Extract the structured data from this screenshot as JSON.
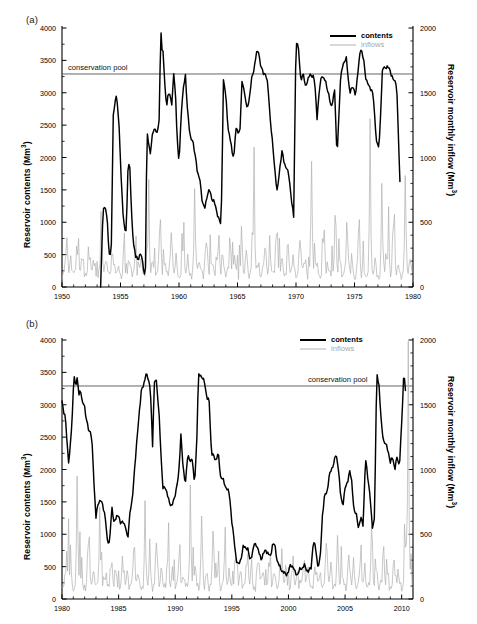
{
  "figure": {
    "background": "#ffffff",
    "panels": [
      {
        "id": "a",
        "tag": "(a)",
        "legend": {
          "contents_label": "contents",
          "inflows_label": "inflows",
          "position": "top-right"
        },
        "conservation_pool_label": "conservation pool",
        "conservation_pool_align": "left"
      },
      {
        "id": "b",
        "tag": "(b)",
        "legend": {
          "contents_label": "contents",
          "inflows_label": "inflows",
          "position": "top-right"
        },
        "conservation_pool_label": "conservation pool",
        "conservation_pool_align": "right"
      }
    ]
  },
  "colors": {
    "contents": "#000000",
    "inflows": "#b0b0b0",
    "conservation_pool": "#555555",
    "axis": "#000000"
  },
  "chart_data": [
    {
      "type": "line",
      "panel": "a",
      "title": "(a)",
      "xlabel": "",
      "ylabel": "Reservoir contents (Mm3)",
      "y2label": "Reservoir monthly inflow (Mm3)",
      "xlim": [
        1950,
        1980
      ],
      "ylim": [
        0,
        4000
      ],
      "y2lim": [
        0,
        2000
      ],
      "xticks": [
        1950,
        1955,
        1960,
        1965,
        1970,
        1975,
        1980
      ],
      "xticklabels": [
        "1950",
        "1955",
        "1960",
        "1965",
        "1970",
        "1975",
        "1980"
      ],
      "yticks": [
        0,
        500,
        1000,
        1500,
        2000,
        2500,
        3000,
        3500,
        4000
      ],
      "yticklabels": [
        "0",
        "500",
        "1000",
        "1500",
        "2000",
        "2500",
        "3000",
        "3500",
        "4000"
      ],
      "y2ticks": [
        0,
        500,
        1000,
        1500,
        2000
      ],
      "y2ticklabels": [
        "0",
        "500",
        "1000",
        "1500",
        "2000"
      ],
      "grid": false,
      "legend": [
        "contents",
        "inflows"
      ],
      "legend_position": "upper right",
      "annotations": [
        {
          "text": "conservation pool",
          "y": 3290,
          "type": "hline",
          "value": 3290
        }
      ],
      "series": [
        {
          "name": "contents",
          "color": "#000000",
          "axis": "left",
          "x": [
            1953.3,
            1953.5,
            1953.7,
            1953.9,
            1954.0,
            1954.1,
            1954.25,
            1954.35,
            1954.45,
            1954.6,
            1954.75,
            1954.9,
            1955.05,
            1955.2,
            1955.35,
            1955.5,
            1955.65,
            1955.8,
            1955.95,
            1956.1,
            1956.3,
            1956.5,
            1956.7,
            1956.9,
            1957.05,
            1957.15,
            1957.25,
            1957.4,
            1957.55,
            1957.7,
            1957.85,
            1958.0,
            1958.15,
            1958.3,
            1958.45,
            1958.55,
            1958.65,
            1958.8,
            1958.95,
            1959.1,
            1959.25,
            1959.4,
            1959.55,
            1959.7,
            1959.85,
            1960.0,
            1960.2,
            1960.4,
            1960.55,
            1960.7,
            1960.85,
            1961.0,
            1961.15,
            1961.3,
            1961.45,
            1961.6,
            1961.8,
            1962.0,
            1962.2,
            1962.4,
            1962.6,
            1962.8,
            1963.0,
            1963.2,
            1963.4,
            1963.6,
            1963.8,
            1964.0,
            1964.2,
            1964.4,
            1964.55,
            1964.7,
            1964.8,
            1964.9,
            1965.0,
            1965.2,
            1965.4,
            1965.6,
            1965.8,
            1966.0,
            1966.2,
            1966.4,
            1966.6,
            1966.8,
            1967.0,
            1967.2,
            1967.4,
            1967.6,
            1967.8,
            1968.0,
            1968.2,
            1968.4,
            1968.6,
            1968.8,
            1969.0,
            1969.2,
            1969.4,
            1969.6,
            1969.8,
            1970.0,
            1970.2,
            1970.4,
            1970.6,
            1970.8,
            1971.0,
            1971.2,
            1971.4,
            1971.5,
            1971.6,
            1971.8,
            1972.0,
            1972.2,
            1972.5,
            1972.8,
            1973.0,
            1973.3,
            1973.5,
            1973.8,
            1974.0,
            1974.3,
            1974.6,
            1974.9,
            1975.1,
            1975.3,
            1975.5,
            1975.8,
            1976.0,
            1976.3,
            1976.6,
            1976.9,
            1977.1,
            1977.4,
            1977.7,
            1978.0,
            1978.3,
            1978.6,
            1978.9,
            1979.1,
            1979.4,
            1979.7,
            1979.9
          ],
          "y": [
            0,
            1180,
            1230,
            1010,
            520,
            450,
            700,
            2660,
            2700,
            2960,
            2840,
            2400,
            1700,
            1200,
            870,
            860,
            1950,
            1830,
            1100,
            700,
            460,
            430,
            520,
            380,
            200,
            320,
            2380,
            2250,
            2060,
            2300,
            2460,
            2430,
            2350,
            2600,
            4000,
            3640,
            3620,
            3100,
            2780,
            3000,
            2970,
            2800,
            3300,
            3000,
            2250,
            1900,
            2720,
            3100,
            3280,
            2800,
            2470,
            2300,
            2280,
            2100,
            1980,
            1740,
            1640,
            1310,
            1200,
            1420,
            1500,
            1370,
            1320,
            1180,
            1060,
            940,
            3200,
            2950,
            2450,
            2250,
            2080,
            2020,
            2300,
            2450,
            2420,
            2380,
            3220,
            3000,
            2750,
            2900,
            3200,
            3360,
            3600,
            3640,
            3400,
            3300,
            3300,
            3100,
            2600,
            2200,
            1800,
            1450,
            1820,
            2100,
            1900,
            1850,
            1700,
            1380,
            1070,
            3830,
            3700,
            3200,
            3300,
            3100,
            3200,
            3270,
            3270,
            3250,
            3150,
            2620,
            3040,
            3280,
            3180,
            2980,
            2750,
            3050,
            2000,
            3180,
            3450,
            3520,
            3000,
            3100,
            2950,
            3340,
            3690,
            3500,
            3170,
            3100,
            2960,
            2200,
            2160,
            3380,
            3400,
            3370,
            3200,
            3150,
            1520
          ],
          "note": "Reservoir contents time series 1953-1980, Mm3"
        },
        {
          "name": "inflows",
          "color": "#b0b0b0",
          "axis": "right",
          "description": "Monthly inflow spikes, baseline ~80-150 Mm3 with frequent peaks 200-600 and occasional peaks 800-1300 Mm3"
        }
      ]
    },
    {
      "type": "line",
      "panel": "b",
      "title": "(b)",
      "xlabel": "",
      "ylabel": "Reservoir contents (Mm3)",
      "y2label": "Reservoir monthly inflow (Mm3)",
      "xlim": [
        1980,
        2011
      ],
      "ylim": [
        0,
        4000
      ],
      "y2lim": [
        0,
        2000
      ],
      "xticks": [
        1980,
        1985,
        1990,
        1995,
        2000,
        2005,
        2010
      ],
      "xticklabels": [
        "1980",
        "1985",
        "1990",
        "1995",
        "2000",
        "2005",
        "2010"
      ],
      "yticks": [
        0,
        500,
        1000,
        1500,
        2000,
        2500,
        3000,
        3500,
        4000
      ],
      "yticklabels": [
        "0",
        "500",
        "1000",
        "1500",
        "2000",
        "2500",
        "3000",
        "3500",
        "4000"
      ],
      "y2ticks": [
        0,
        500,
        1000,
        1500,
        2000
      ],
      "y2ticklabels": [
        "0",
        "500",
        "1000",
        "1500",
        "2000"
      ],
      "grid": false,
      "legend": [
        "contents",
        "inflows"
      ],
      "legend_position": "upper right",
      "annotations": [
        {
          "text": "conservation pool",
          "y": 3290,
          "type": "hline",
          "value": 3290
        }
      ],
      "series": [
        {
          "name": "contents",
          "color": "#000000",
          "axis": "left",
          "x": [
            1980.0,
            1980.15,
            1980.3,
            1980.45,
            1980.6,
            1980.75,
            1980.9,
            1981.05,
            1981.2,
            1981.35,
            1981.5,
            1981.65,
            1981.8,
            1981.95,
            1982.1,
            1982.25,
            1982.4,
            1982.55,
            1982.7,
            1982.85,
            1983.0,
            1983.2,
            1983.4,
            1983.6,
            1983.8,
            1984.0,
            1984.2,
            1984.4,
            1984.6,
            1984.8,
            1985.0,
            1985.2,
            1985.4,
            1985.6,
            1985.8,
            1986.0,
            1986.2,
            1986.4,
            1986.6,
            1986.8,
            1987.0,
            1987.2,
            1987.4,
            1987.6,
            1987.8,
            1988.0,
            1988.15,
            1988.3,
            1988.45,
            1988.6,
            1988.75,
            1988.9,
            1989.1,
            1989.3,
            1989.5,
            1989.7,
            1989.9,
            1990.1,
            1990.3,
            1990.5,
            1990.7,
            1990.9,
            1991.1,
            1991.3,
            1991.5,
            1991.7,
            1991.9,
            1992.05,
            1992.2,
            1992.4,
            1992.6,
            1992.8,
            1993.0,
            1993.2,
            1993.4,
            1993.6,
            1993.8,
            1994.0,
            1994.2,
            1994.4,
            1994.6,
            1994.8,
            1995.0,
            1995.2,
            1995.4,
            1995.6,
            1995.8,
            1996.0,
            1996.2,
            1996.4,
            1996.6,
            1996.8,
            1997.0,
            1997.2,
            1997.4,
            1997.6,
            1997.8,
            1998.0,
            1998.2,
            1998.4,
            1998.6,
            1998.8,
            1999.0,
            1999.2,
            1999.4,
            1999.6,
            1999.8,
            2000.0,
            2000.2,
            2000.4,
            2000.6,
            2000.8,
            2001.0,
            2001.2,
            2001.4,
            2001.6,
            2001.8,
            2002.0,
            2002.2,
            2002.4,
            2002.6,
            2002.8,
            2003.0,
            2003.2,
            2003.4,
            2003.6,
            2003.8,
            2004.0,
            2004.2,
            2004.4,
            2004.6,
            2004.8,
            2005.0,
            2005.2,
            2005.4,
            2005.6,
            2005.8,
            2006.0,
            2006.2,
            2006.4,
            2006.6,
            2006.8,
            2007.0,
            2007.2,
            2007.4,
            2007.6,
            2007.8,
            2008.0,
            2008.2,
            2008.4,
            2008.6,
            2008.8,
            2009.0,
            2009.2,
            2009.4,
            2009.6,
            2009.8,
            2010.0,
            2010.2,
            2010.4,
            2010.6,
            2010.8
          ],
          "y": [
            3060,
            2900,
            2800,
            2400,
            2100,
            2400,
            2780,
            3500,
            3260,
            3420,
            3180,
            3200,
            3020,
            3050,
            2800,
            2700,
            2600,
            2560,
            2300,
            1700,
            1250,
            1500,
            1520,
            1450,
            1300,
            900,
            880,
            1400,
            1200,
            1250,
            1300,
            1150,
            1200,
            1130,
            900,
            1350,
            1500,
            2000,
            2400,
            2850,
            3200,
            3300,
            3480,
            3400,
            3280,
            2350,
            3350,
            3430,
            3100,
            2800,
            2200,
            1700,
            1750,
            1600,
            1500,
            1420,
            1550,
            1700,
            1900,
            2550,
            2000,
            1800,
            2200,
            2150,
            2150,
            1780,
            2400,
            3450,
            3480,
            3400,
            3350,
            3100,
            3050,
            2250,
            2200,
            2150,
            2250,
            1900,
            1850,
            1750,
            1700,
            1600,
            1200,
            900,
            600,
            520,
            620,
            800,
            800,
            780,
            600,
            700,
            850,
            840,
            700,
            620,
            700,
            760,
            700,
            650,
            850,
            830,
            600,
            500,
            450,
            400,
            380,
            420,
            530,
            500,
            400,
            380,
            450,
            480,
            520,
            450,
            430,
            480,
            900,
            780,
            500,
            600,
            1300,
            1600,
            1650,
            1900,
            2000,
            2100,
            2230,
            2050,
            1600,
            1450,
            1700,
            1800,
            1980,
            1800,
            1350,
            1300,
            1100,
            1250,
            1150,
            2170,
            1900,
            1600,
            1100,
            1250,
            3500,
            3300,
            2700,
            2450,
            2380,
            2300,
            2100,
            2200,
            2000,
            2200,
            2050,
            2700,
            3550,
            3050
          ],
          "note": "Reservoir contents time series 1980-2011, Mm3"
        },
        {
          "name": "inflows",
          "color": "#b0b0b0",
          "axis": "right",
          "description": "Monthly inflow spikes, baseline ~60-150 Mm3 with frequent peaks 200-600 and occasional peaks up to 950 Mm3 in 1981 and 2010"
        }
      ]
    }
  ]
}
